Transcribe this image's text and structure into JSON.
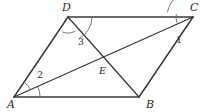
{
  "figure": {
    "kind": "geometry-diagram",
    "shape": "parallelogram",
    "width": 207,
    "height": 112,
    "background_color": "#ffffff",
    "stroke_color": "#3a3a3a",
    "label_color": "#2b2b2b",
    "arc_color": "#6b6b6b"
  },
  "vertices": [
    {
      "id": "A",
      "label": "A",
      "x": 14,
      "y": 97,
      "label_x": 7,
      "label_y": 108
    },
    {
      "id": "B",
      "label": "B",
      "x": 139,
      "y": 97,
      "label_x": 146,
      "label_y": 108
    },
    {
      "id": "C",
      "label": "C",
      "x": 193,
      "y": 17,
      "label_x": 190,
      "label_y": 11
    },
    {
      "id": "D",
      "label": "D",
      "x": 68,
      "y": 17,
      "label_x": 62,
      "label_y": 11
    },
    {
      "id": "E",
      "label": "E",
      "x": 104,
      "y": 62,
      "label_x": 99,
      "label_y": 74
    }
  ],
  "segments": [
    {
      "id": "AB",
      "from": "A",
      "to": "B",
      "role": "side"
    },
    {
      "id": "BC",
      "from": "B",
      "to": "C",
      "role": "side"
    },
    {
      "id": "CD",
      "from": "C",
      "to": "D",
      "role": "side"
    },
    {
      "id": "DA",
      "from": "D",
      "to": "A",
      "role": "side"
    },
    {
      "id": "AC",
      "from": "A",
      "to": "C",
      "role": "diagonal"
    },
    {
      "id": "DB",
      "from": "D",
      "to": "B",
      "role": "diagonal"
    }
  ],
  "angles": [
    {
      "id": "angle-1",
      "label": "1",
      "at": "C",
      "between": [
        "CA",
        "CB"
      ],
      "label_x": 176,
      "label_y": 43,
      "arc": {
        "cx": 193,
        "cy": 17,
        "r": 26,
        "a1": 190,
        "a2": 235
      }
    },
    {
      "id": "angle-2",
      "label": "2",
      "at": "A",
      "between": [
        "AC",
        "AB"
      ],
      "label_x": 37,
      "label_y": 78,
      "arc": {
        "cx": 14,
        "cy": 97,
        "r": 26,
        "a1": -23,
        "a2": 0
      }
    },
    {
      "id": "angle-3",
      "label": "3",
      "at": "D",
      "between": [
        "DB",
        "DC"
      ],
      "label_x": 78,
      "label_y": 45,
      "arc": {
        "cx": 68,
        "cy": 17,
        "r": 24,
        "a1": 0,
        "a2": 62
      }
    },
    {
      "id": "angle-unmarked-d",
      "label": "",
      "at": "D",
      "between": [
        "DA",
        "DB"
      ],
      "label_x": 0,
      "label_y": 0,
      "arc": {
        "cx": 68,
        "cy": 17,
        "r": 16,
        "a1": 62,
        "a2": 112
      }
    },
    {
      "id": "angle-unmarked-c",
      "label": "",
      "at": "C",
      "between": [
        "CD",
        "CA"
      ],
      "label_x": 0,
      "label_y": 0,
      "arc": {
        "cx": 193,
        "cy": 17,
        "r": 17,
        "a1": 160,
        "a2": 190
      }
    },
    {
      "id": "angle-unmarked-a",
      "label": "",
      "at": "A",
      "between": [
        "AD",
        "AC"
      ],
      "label_x": 0,
      "label_y": 0,
      "arc": {
        "cx": 14,
        "cy": 97,
        "r": 18,
        "a1": -58,
        "a2": -23
      }
    }
  ]
}
